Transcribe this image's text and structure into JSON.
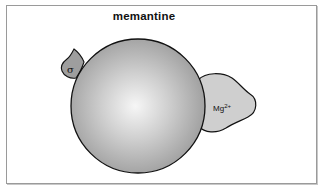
{
  "diagram": {
    "title": "memantine",
    "central_body": {
      "shape": "sphere",
      "fill_center": "#f4f4f4",
      "fill_edge": "#9a9a9a"
    },
    "left_site": {
      "label": "σ",
      "fill": "#9e9e9e"
    },
    "right_site": {
      "label_base": "Mg",
      "label_sup": "2+",
      "fill": "#cfcfcf"
    }
  }
}
